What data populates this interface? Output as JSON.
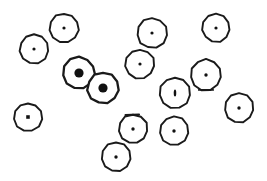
{
  "figure": {
    "title": "",
    "background_color": "#ffffff",
    "outline_color": "#1a1a1a",
    "nucleus_color": "#111111",
    "width": 267,
    "height": 181,
    "object_count": 14,
    "object_label": "circle"
  },
  "chart_data": {
    "type": "scatter",
    "title": "",
    "xlabel": "",
    "ylabel": "",
    "xlim": [
      0,
      267
    ],
    "ylim": [
      0,
      181
    ],
    "grid": false,
    "legend": null,
    "marker_shape": "circle-with-center-dot",
    "points": [
      {
        "id": "c1",
        "x": 34,
        "y": 49,
        "r": 14.5,
        "dot_r": 1.6,
        "dot_dx": 0,
        "dot_dy": 0,
        "dot_type": "small",
        "variant": "plain"
      },
      {
        "id": "c2",
        "x": 64,
        "y": 28,
        "r": 14.5,
        "dot_r": 1.6,
        "dot_dx": 0,
        "dot_dy": 0,
        "dot_type": "small",
        "variant": "plain"
      },
      {
        "id": "c3",
        "x": 152,
        "y": 33,
        "r": 15.0,
        "dot_r": 1.6,
        "dot_dx": 0,
        "dot_dy": 0,
        "dot_type": "small",
        "variant": "plain"
      },
      {
        "id": "c4",
        "x": 216,
        "y": 28,
        "r": 14.0,
        "dot_r": 1.6,
        "dot_dx": 0,
        "dot_dy": 0,
        "dot_type": "small",
        "variant": "plain"
      },
      {
        "id": "c5",
        "x": 140,
        "y": 64,
        "r": 14.5,
        "dot_r": 1.6,
        "dot_dx": 0,
        "dot_dy": 0,
        "dot_type": "small",
        "variant": "plain"
      },
      {
        "id": "c6",
        "x": 79,
        "y": 73,
        "r": 16.0,
        "dot_r": 4.6,
        "dot_dx": 0,
        "dot_dy": 0,
        "dot_type": "large",
        "variant": "plain"
      },
      {
        "id": "c7",
        "x": 103,
        "y": 88,
        "r": 15.5,
        "dot_r": 4.6,
        "dot_dx": 0,
        "dot_dy": 0,
        "dot_type": "large",
        "variant": "plain"
      },
      {
        "id": "c8",
        "x": 206,
        "y": 75,
        "r": 15.5,
        "dot_r": 1.7,
        "dot_dx": 0,
        "dot_dy": 0,
        "dot_type": "small",
        "variant": "flat-bottom"
      },
      {
        "id": "c9",
        "x": 175,
        "y": 93,
        "r": 15.5,
        "dot_r": 1.5,
        "dot_dx": 0,
        "dot_dy": 0,
        "dot_type": "oval-v",
        "variant": "plain"
      },
      {
        "id": "c10",
        "x": 239,
        "y": 108,
        "r": 14.5,
        "dot_r": 1.7,
        "dot_dx": 0,
        "dot_dy": 0,
        "dot_type": "small",
        "variant": "plain"
      },
      {
        "id": "c11",
        "x": 28,
        "y": 117,
        "r": 14.0,
        "dot_r": 1.7,
        "dot_dx": 0,
        "dot_dy": 0,
        "dot_type": "square",
        "variant": "plain"
      },
      {
        "id": "c12",
        "x": 133,
        "y": 129,
        "r": 14.5,
        "dot_r": 1.7,
        "dot_dx": 0,
        "dot_dy": 0,
        "dot_type": "small",
        "variant": "flat-top"
      },
      {
        "id": "c13",
        "x": 174,
        "y": 131,
        "r": 14.5,
        "dot_r": 1.7,
        "dot_dx": 0,
        "dot_dy": 0,
        "dot_type": "small",
        "variant": "plain"
      },
      {
        "id": "c14",
        "x": 116,
        "y": 157,
        "r": 14.5,
        "dot_r": 1.7,
        "dot_dx": 0,
        "dot_dy": 0,
        "dot_type": "small",
        "variant": "plain"
      }
    ]
  }
}
